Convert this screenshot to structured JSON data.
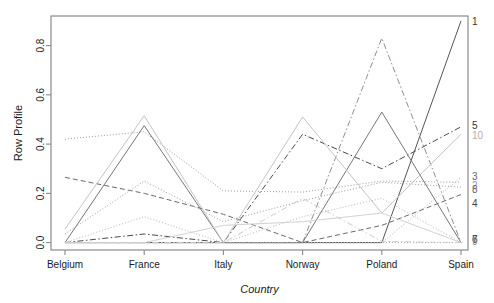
{
  "chart_data": {
    "type": "line",
    "title": "",
    "xlabel": "Country",
    "ylabel": "Row Profile",
    "categories": [
      "Belgium",
      "France",
      "Italy",
      "Norway",
      "Poland",
      "Spain"
    ],
    "x_tick_labels": [
      "Belgium",
      "France",
      "Italy",
      "Norway",
      "Poland",
      "Spain"
    ],
    "y_tick_labels": [
      "0.0",
      "0.2",
      "0.4",
      "0.6",
      "0.8"
    ],
    "y_ticks": [
      0.0,
      0.2,
      0.4,
      0.6,
      0.8
    ],
    "ylim": [
      -0.03,
      0.92
    ],
    "grid": false,
    "legend_position": "right-edge-labels",
    "series": [
      {
        "name": "1",
        "label": "1",
        "color": "#555555",
        "dash": "none",
        "values": [
          0.0,
          0.0,
          0.0,
          0.0,
          0.0,
          0.9
        ]
      },
      {
        "name": "2",
        "label": "2",
        "color": "#9a9a9a",
        "dash": "dotted",
        "values": [
          0.42,
          0.45,
          0.21,
          0.205,
          0.25,
          0.245
        ]
      },
      {
        "name": "3",
        "label": "3",
        "color": "#b0b0b0",
        "dash": "dotted",
        "values": [
          0.0,
          0.0,
          0.0,
          0.0,
          0.0,
          0.265
        ]
      },
      {
        "name": "4",
        "label": "4",
        "color": "#6a6a6a",
        "dash": "dashed",
        "values": [
          0.265,
          0.2,
          0.115,
          0.0,
          0.07,
          0.195
        ]
      },
      {
        "name": "5",
        "label": "5",
        "color": "#4a4a4a",
        "dash": "dashdot",
        "values": [
          0.0,
          0.035,
          0.0,
          0.44,
          0.3,
          0.47
        ]
      },
      {
        "name": "6",
        "label": "6",
        "color": "#777777",
        "dash": "solid",
        "values": [
          0.0,
          0.475,
          0.0,
          0.0,
          0.53,
          0.0
        ]
      },
      {
        "name": "7",
        "label": "7",
        "color": "#8f8f8f",
        "dash": "dashdot",
        "values": [
          0.0,
          0.0,
          0.0,
          0.0,
          0.83,
          0.0
        ]
      },
      {
        "name": "8",
        "label": "8",
        "color": "#9d9d9d",
        "dash": "dotted",
        "values": [
          0.035,
          0.25,
          0.085,
          0.17,
          0.245,
          0.225
        ]
      },
      {
        "name": "9",
        "label": "9",
        "color": "#a8a8a8",
        "dash": "dotted",
        "values": [
          0.0,
          0.0,
          0.0,
          0.0,
          0.0,
          0.0
        ]
      },
      {
        "name": "10",
        "label": "10",
        "color": "#c4c4c4",
        "dash": "solid",
        "values": [
          0.055,
          0.515,
          0.0,
          0.51,
          0.12,
          0.44
        ]
      },
      {
        "name": "11",
        "label": "",
        "color": "#b8b8b8",
        "dash": "dotted",
        "values": [
          0.0,
          0.105,
          0.0,
          0.105,
          0.18,
          0.0
        ]
      },
      {
        "name": "12",
        "label": "",
        "color": "#cccccc",
        "dash": "dashdot",
        "values": [
          0.0,
          0.0,
          0.0,
          0.18,
          0.005,
          0.0
        ]
      },
      {
        "name": "13",
        "label": "",
        "color": "#d2d2d2",
        "dash": "solid",
        "values": [
          0.0,
          0.0,
          0.07,
          0.085,
          0.12,
          0.0
        ]
      }
    ],
    "series_edge_labels": [
      {
        "text": "1",
        "y": 0.895,
        "color": "#333333"
      },
      {
        "text": "5",
        "y": 0.472,
        "color": "#333333"
      },
      {
        "text": "10",
        "y": 0.432,
        "color": "#b0b0b0"
      },
      {
        "text": "3",
        "y": 0.268,
        "color": "#666666"
      },
      {
        "text": "2",
        "y": 0.228,
        "color": "#999999"
      },
      {
        "text": "8",
        "y": 0.212,
        "color": "#666666"
      },
      {
        "text": "4",
        "y": 0.158,
        "color": "#444444"
      },
      {
        "text": "6",
        "y": 0.012,
        "color": "#444444"
      },
      {
        "text": "7",
        "y": 0.01,
        "color": "#444444"
      },
      {
        "text": "9",
        "y": 0.002,
        "color": "#888888"
      }
    ]
  },
  "axes": {
    "y_axis_title": "Row Profile",
    "x_axis_title": "Country"
  }
}
